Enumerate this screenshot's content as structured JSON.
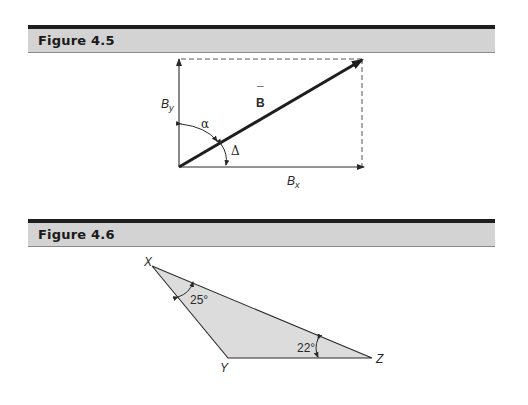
{
  "figures": [
    {
      "header": "Figure 4.5",
      "labels": {
        "vector": "B",
        "vector_accent": "¯",
        "y_component": "B",
        "y_subscript": "y",
        "x_component": "B",
        "x_subscript": "x",
        "angle_alpha": "α",
        "angle_delta": "Δ"
      }
    },
    {
      "header": "Figure 4.6",
      "labels": {
        "vertex_x": "X",
        "vertex_y": "Y",
        "vertex_z": "Z",
        "angle_x": "25°",
        "angle_z": "22°"
      }
    }
  ],
  "colors": {
    "header_band": "#d3d3d3",
    "header_rule": "#1e1e1e",
    "triangle_fill": "#dcdcdc",
    "line": "#2a2a2a"
  }
}
